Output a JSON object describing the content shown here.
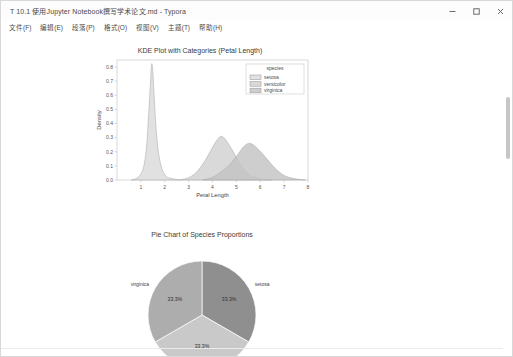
{
  "window": {
    "title": "T 10.1 使用Jupyter Notebook撰写学术论文.md - Typora",
    "controls": [
      {
        "name": "minimize",
        "glyph": "minimize-icon"
      },
      {
        "name": "maximize",
        "glyph": "maximize-icon"
      },
      {
        "name": "close",
        "glyph": "close-icon"
      }
    ]
  },
  "menubar": {
    "items": [
      {
        "label": "文件(F)",
        "name": "menu-file"
      },
      {
        "label": "编辑(E)",
        "name": "menu-edit"
      },
      {
        "label": "段落(P)",
        "name": "menu-paragraph"
      },
      {
        "label": "格式(O)",
        "name": "menu-format"
      },
      {
        "label": "视图(V)",
        "name": "menu-view"
      },
      {
        "label": "主题(T)",
        "name": "menu-theme"
      },
      {
        "label": "帮助(H)",
        "name": "menu-help"
      }
    ]
  },
  "colors": {
    "setosa": "#d9d9d9",
    "versicolor": "#d0d0d0",
    "virginica": "#c2c2c2",
    "pie_setosa": "#8f8f8f",
    "pie_versicolor": "#c9c9c9",
    "pie_virginica": "#adadad",
    "axis": "#cfcfcf",
    "text": "#444444"
  },
  "chart_data": [
    {
      "type": "area",
      "name": "kde-plot",
      "title": "KDE Plot with Categories (Petal Length)",
      "xlabel": "Petal Length",
      "ylabel": "Density",
      "xlim": [
        0.0,
        8.0
      ],
      "ylim": [
        0.0,
        0.85
      ],
      "xticks": [
        "1",
        "2",
        "3",
        "4",
        "5",
        "6",
        "7",
        "8"
      ],
      "xtick_values": [
        1,
        2,
        3,
        4,
        5,
        6,
        7,
        8
      ],
      "yticks": [
        "0.0",
        "0.1",
        "0.2",
        "0.3",
        "0.4",
        "0.5",
        "0.6",
        "0.7",
        "0.8"
      ],
      "ytick_values": [
        0.0,
        0.1,
        0.2,
        0.3,
        0.4,
        0.5,
        0.6,
        0.7,
        0.8
      ],
      "grid": false,
      "legend": {
        "title": "species",
        "position": "upper right",
        "entries": [
          "setosa",
          "versicolor",
          "virginica"
        ]
      },
      "series": [
        {
          "name": "setosa",
          "peak_x": 1.45,
          "peak_y": 0.82,
          "points": [
            [
              0.6,
              0.0
            ],
            [
              0.8,
              0.01
            ],
            [
              0.95,
              0.03
            ],
            [
              1.05,
              0.06
            ],
            [
              1.15,
              0.12
            ],
            [
              1.25,
              0.26
            ],
            [
              1.33,
              0.48
            ],
            [
              1.4,
              0.68
            ],
            [
              1.45,
              0.82
            ],
            [
              1.5,
              0.77
            ],
            [
              1.56,
              0.58
            ],
            [
              1.64,
              0.36
            ],
            [
              1.74,
              0.19
            ],
            [
              1.85,
              0.1
            ],
            [
              1.95,
              0.05
            ],
            [
              2.1,
              0.02
            ],
            [
              2.3,
              0.01
            ],
            [
              2.6,
              0.0
            ]
          ]
        },
        {
          "name": "versicolor",
          "peak_x": 4.35,
          "peak_y": 0.31,
          "points": [
            [
              2.6,
              0.0
            ],
            [
              2.9,
              0.01
            ],
            [
              3.1,
              0.025
            ],
            [
              3.3,
              0.05
            ],
            [
              3.5,
              0.09
            ],
            [
              3.7,
              0.14
            ],
            [
              3.9,
              0.2
            ],
            [
              4.1,
              0.26
            ],
            [
              4.25,
              0.295
            ],
            [
              4.35,
              0.31
            ],
            [
              4.5,
              0.295
            ],
            [
              4.65,
              0.26
            ],
            [
              4.8,
              0.22
            ],
            [
              5.0,
              0.16
            ],
            [
              5.2,
              0.1
            ],
            [
              5.4,
              0.06
            ],
            [
              5.6,
              0.03
            ],
            [
              5.9,
              0.012
            ],
            [
              6.2,
              0.004
            ],
            [
              6.5,
              0.0
            ]
          ]
        },
        {
          "name": "virginica",
          "peak_x": 5.55,
          "peak_y": 0.26,
          "points": [
            [
              3.6,
              0.0
            ],
            [
              3.9,
              0.012
            ],
            [
              4.1,
              0.028
            ],
            [
              4.3,
              0.05
            ],
            [
              4.5,
              0.075
            ],
            [
              4.7,
              0.105
            ],
            [
              4.9,
              0.145
            ],
            [
              5.1,
              0.19
            ],
            [
              5.3,
              0.235
            ],
            [
              5.45,
              0.255
            ],
            [
              5.55,
              0.26
            ],
            [
              5.7,
              0.25
            ],
            [
              5.9,
              0.22
            ],
            [
              6.1,
              0.185
            ],
            [
              6.3,
              0.145
            ],
            [
              6.5,
              0.105
            ],
            [
              6.7,
              0.07
            ],
            [
              6.9,
              0.043
            ],
            [
              7.1,
              0.025
            ],
            [
              7.35,
              0.012
            ],
            [
              7.6,
              0.005
            ],
            [
              7.9,
              0.0
            ]
          ]
        }
      ]
    },
    {
      "type": "pie",
      "name": "pie-chart",
      "title": "Pie Chart of Species Proportions",
      "labels": [
        "setosa",
        "versicolor",
        "virginica"
      ],
      "values": [
        33.3,
        33.3,
        33.3
      ],
      "display_values": [
        "33.3%",
        "33.3%",
        "33.3%"
      ],
      "start_angle": 90,
      "counterclock": false
    }
  ]
}
